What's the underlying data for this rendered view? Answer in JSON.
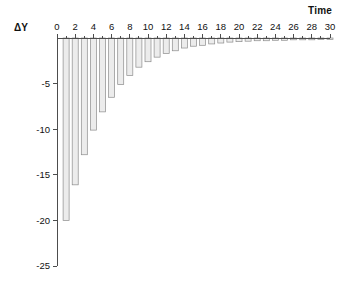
{
  "figure": {
    "width": 344,
    "height": 295,
    "background": "#ffffff"
  },
  "labels": {
    "y_axis_label": "ΔY",
    "x_axis_title": "Time"
  },
  "style": {
    "bar_fill": "#ececec",
    "bar_stroke": "#8c8c8c",
    "axis_color": "#4d4d4d",
    "text_color": "#111111"
  },
  "chart_data": {
    "type": "bar",
    "title": "",
    "subtitle": "",
    "xlabel": "Time",
    "ylabel": "ΔY",
    "xlim": [
      0,
      30
    ],
    "ylim": [
      -25,
      0
    ],
    "grid": false,
    "legend": false,
    "legend_position": "none",
    "orientation": "vertical",
    "bars_point": "down",
    "x_tick_labels": [
      "0",
      "2",
      "4",
      "6",
      "8",
      "10",
      "12",
      "14",
      "16",
      "18",
      "20",
      "22",
      "24",
      "26",
      "28",
      "30"
    ],
    "x_major_ticks": [
      0,
      2,
      4,
      6,
      8,
      10,
      12,
      14,
      16,
      18,
      20,
      22,
      24,
      26,
      28,
      30
    ],
    "x_minor_ticks": [
      1,
      3,
      5,
      7,
      9,
      11,
      13,
      15,
      17,
      19,
      21,
      23,
      25,
      27,
      29
    ],
    "y_tick_labels": [
      "-5",
      "-10",
      "-15",
      "-20",
      "-25"
    ],
    "y_major_ticks": [
      -5,
      -10,
      -15,
      -20,
      -25
    ],
    "categories": [
      1,
      2,
      3,
      4,
      5,
      6,
      7,
      8,
      9,
      10,
      11,
      12,
      13,
      14,
      15,
      16,
      17,
      18,
      19,
      20,
      21,
      22,
      23,
      24,
      25,
      26,
      27,
      28,
      29,
      30
    ],
    "values": [
      -20.0,
      -16.1,
      -12.8,
      -10.1,
      -8.1,
      -6.5,
      -5.1,
      -4.1,
      -3.2,
      -2.6,
      -2.1,
      -1.7,
      -1.4,
      -1.1,
      -0.9,
      -0.8,
      -0.65,
      -0.55,
      -0.45,
      -0.4,
      -0.35,
      -0.3,
      -0.3,
      -0.25,
      -0.25,
      -0.2,
      -0.2,
      -0.2,
      -0.15,
      -0.15
    ],
    "series": [
      {
        "name": "ΔY",
        "values": [
          -20.0,
          -16.1,
          -12.8,
          -10.1,
          -8.1,
          -6.5,
          -5.1,
          -4.1,
          -3.2,
          -2.6,
          -2.1,
          -1.7,
          -1.4,
          -1.1,
          -0.9,
          -0.8,
          -0.65,
          -0.55,
          -0.45,
          -0.4,
          -0.35,
          -0.3,
          -0.3,
          -0.25,
          -0.25,
          -0.2,
          -0.2,
          -0.2,
          -0.15,
          -0.15
        ]
      }
    ]
  }
}
